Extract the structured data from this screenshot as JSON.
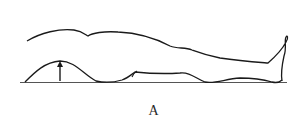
{
  "figure": {
    "caption": "A",
    "stroke_color": "#1a1a1a",
    "arrow_direction": "up"
  }
}
